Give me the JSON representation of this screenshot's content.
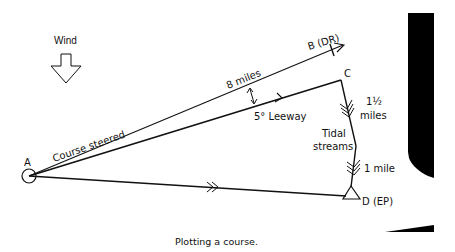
{
  "diagram": {
    "caption": "Plotting a course.",
    "wind": {
      "label": "Wind",
      "icon": "down-arrow-icon"
    },
    "points": {
      "A": {
        "label": "A"
      },
      "B": {
        "label": "B (DR)"
      },
      "C": {
        "label": "C"
      },
      "D": {
        "label": "D (EP)"
      }
    },
    "labels": {
      "course_steered": "Course steered",
      "distance": "8 miles",
      "leeway": "5° Leeway",
      "tidal_streams_line1": "Tidal",
      "tidal_streams_line2": "streams",
      "tide_1_line1": "1½",
      "tide_1_line2": "miles",
      "tide_2": "1 mile"
    },
    "colors": {
      "ink": "#111111",
      "background": "#ffffff"
    }
  }
}
